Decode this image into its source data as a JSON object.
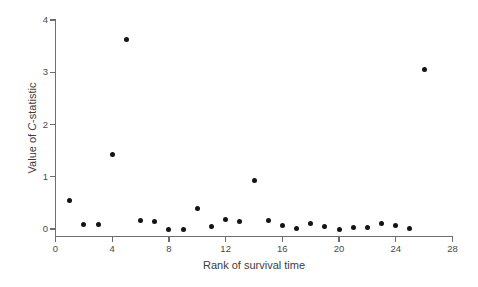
{
  "chart_data": {
    "type": "scatter",
    "title": "",
    "xlabel": "Rank of survival time",
    "ylabel": "Value of C-statistic",
    "ylabel_parts": {
      "prefix": "Value of ",
      "italic": "C",
      "suffix": "-statistic"
    },
    "xlim": [
      0,
      28
    ],
    "ylim": [
      0,
      4
    ],
    "xticks": [
      0,
      4,
      8,
      12,
      16,
      20,
      24,
      28
    ],
    "yticks": [
      0,
      1,
      2,
      3,
      4
    ],
    "grid": false,
    "legend": null,
    "marker": {
      "shape": "circle",
      "color": "#141414",
      "size": 5
    },
    "x": [
      1,
      2,
      3,
      4,
      5,
      6,
      7,
      8,
      9,
      10,
      11,
      12,
      13,
      14,
      15,
      16,
      17,
      18,
      19,
      20,
      21,
      22,
      23,
      24,
      25,
      26
    ],
    "y": [
      0.54,
      0.08,
      0.09,
      1.43,
      3.63,
      0.16,
      0.14,
      0.0,
      0.0,
      0.4,
      0.04,
      0.19,
      0.15,
      0.92,
      0.17,
      0.07,
      0.01,
      0.1,
      0.05,
      0.0,
      0.03,
      0.02,
      0.11,
      0.07,
      0.01,
      3.06
    ],
    "points": [
      {
        "rank": 1,
        "value": 0.54
      },
      {
        "rank": 2,
        "value": 0.08
      },
      {
        "rank": 3,
        "value": 0.09
      },
      {
        "rank": 4,
        "value": 1.43
      },
      {
        "rank": 5,
        "value": 3.63
      },
      {
        "rank": 6,
        "value": 0.16
      },
      {
        "rank": 7,
        "value": 0.14
      },
      {
        "rank": 8,
        "value": 0.0
      },
      {
        "rank": 9,
        "value": 0.0
      },
      {
        "rank": 10,
        "value": 0.4
      },
      {
        "rank": 11,
        "value": 0.04
      },
      {
        "rank": 12,
        "value": 0.19
      },
      {
        "rank": 13,
        "value": 0.15
      },
      {
        "rank": 14,
        "value": 0.92
      },
      {
        "rank": 15,
        "value": 0.17
      },
      {
        "rank": 16,
        "value": 0.07
      },
      {
        "rank": 17,
        "value": 0.01
      },
      {
        "rank": 18,
        "value": 0.1
      },
      {
        "rank": 19,
        "value": 0.05
      },
      {
        "rank": 20,
        "value": 0.0
      },
      {
        "rank": 21,
        "value": 0.03
      },
      {
        "rank": 22,
        "value": 0.02
      },
      {
        "rank": 23,
        "value": 0.11
      },
      {
        "rank": 24,
        "value": 0.07
      },
      {
        "rank": 25,
        "value": 0.01
      },
      {
        "rank": 26,
        "value": 3.06
      }
    ]
  },
  "colors": {
    "axis": "#6e6e6e",
    "marker": "#141414",
    "text": "#3d3d3d",
    "background": "#ffffff"
  }
}
